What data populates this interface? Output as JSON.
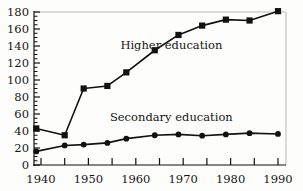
{
  "chart_data": {
    "type": "line",
    "title": "",
    "subtitle": "",
    "xlabel": "",
    "ylabel": "",
    "xlim": [
      1938,
      1992
    ],
    "ylim": [
      0,
      180
    ],
    "grid": false,
    "legend_position": "inline-annotation",
    "x_ticks_major": [
      1940,
      1950,
      1960,
      1970,
      1980,
      1990
    ],
    "x_tick_labels": [
      "1940",
      "1950",
      "1960",
      "1970",
      "1980",
      "1990"
    ],
    "x_ticks_minor": [
      1945,
      1955,
      1965,
      1975,
      1985
    ],
    "y_ticks_major": [
      0,
      20,
      40,
      60,
      80,
      100,
      120,
      140,
      160,
      180
    ],
    "y_tick_labels": [
      "0",
      "20",
      "40",
      "60",
      "80",
      "100",
      "120",
      "140",
      "160",
      "180"
    ],
    "y_minor_tick_step": 5,
    "series": [
      {
        "name": "Higher education",
        "marker": "square",
        "color": "#111111",
        "label_x": 1967.5,
        "label_y": 137,
        "x": [
          1939,
          1945,
          1949,
          1954,
          1958,
          1964,
          1969,
          1974,
          1979,
          1984,
          1990
        ],
        "values": [
          43,
          35,
          90,
          93,
          109,
          135,
          153,
          164,
          171,
          170,
          181
        ]
      },
      {
        "name": "Secondary education",
        "marker": "circle",
        "color": "#111111",
        "label_x": 1967.5,
        "label_y": 52,
        "x": [
          1939,
          1945,
          1949,
          1954,
          1958,
          1964,
          1969,
          1974,
          1979,
          1984,
          1990
        ],
        "values": [
          16,
          23,
          24,
          26,
          31,
          35,
          36,
          34.5,
          36,
          37.5,
          36.5
        ]
      }
    ]
  },
  "axes": {
    "axis_color": "#111111",
    "frame_color": "#b9b9b9",
    "plot_background": "#fdfdfb"
  }
}
